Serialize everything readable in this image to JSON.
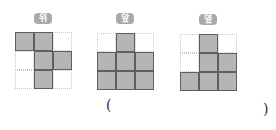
{
  "views": [
    {
      "label": "위",
      "cells": [
        [
          1,
          1,
          0
        ],
        [
          0,
          1,
          1
        ],
        [
          0,
          1,
          0
        ]
      ]
    },
    {
      "label": "앞",
      "cells": [
        [
          0,
          1,
          0
        ],
        [
          1,
          1,
          1
        ],
        [
          1,
          1,
          1
        ]
      ]
    },
    {
      "label": "옆",
      "cells": [
        [
          0,
          1,
          0
        ],
        [
          0,
          1,
          1
        ],
        [
          1,
          1,
          1
        ]
      ]
    }
  ],
  "answer": {
    "open_paren": "(",
    "close_paren": ")",
    "value": ""
  },
  "colors": {
    "filled_cell": "#b5b5b5",
    "cell_border": "#5f5f5f",
    "dotted_grid": "#c8c8c8",
    "label_bg": "#a9a9a9"
  }
}
